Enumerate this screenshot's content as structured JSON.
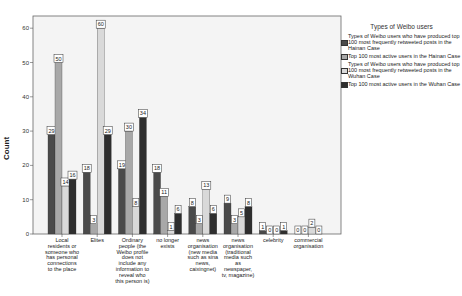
{
  "chart_data": {
    "type": "bar",
    "title": "",
    "xlabel": "",
    "ylabel": "Count",
    "ylim": [
      0,
      63
    ],
    "yticks": [
      0,
      10,
      20,
      30,
      40,
      50,
      60
    ],
    "grid": false,
    "legend_position": "right",
    "legend_title": "Types of Weibo users",
    "categories": [
      "Local residents or someone who has personal connections to the place",
      "Elites",
      "Ordinary people (the Weibo profile does not include any information to reveal who this person is)",
      "no longer exists",
      "news organisation (new media such as sina news, caixingnet)",
      "news organisation (traditional media such as newspaper, tv, magazine)",
      "celebrity",
      "commercial organisation"
    ],
    "series": [
      {
        "name": "Types of Weibo users who have produced top 100 most frequently retweeted posts in the Hainan Case",
        "color": "#4a4a4a",
        "values": [
          29,
          18,
          19,
          18,
          8,
          9,
          1,
          0
        ]
      },
      {
        "name": "Top 100 most active users in the Hainan Case",
        "color": "#a8a8a8",
        "values": [
          50,
          3,
          30,
          11,
          3,
          3,
          0,
          0
        ]
      },
      {
        "name": "Types of Weibo users who have produced top 100 most frequently retweeted posts in the Wuhan Case",
        "color": "#d9d9d9",
        "values": [
          14,
          60,
          8,
          1,
          13,
          5,
          0,
          2
        ]
      },
      {
        "name": "Top 100 most active users in the Wuhan Case",
        "color": "#2e2e2e",
        "values": [
          16,
          29,
          34,
          6,
          6,
          8,
          1,
          0
        ]
      }
    ]
  },
  "axis": {
    "ylabel": "Count",
    "ticks": [
      "0",
      "10",
      "20",
      "30",
      "40",
      "50",
      "60"
    ]
  },
  "xlabels": [
    [
      "Local",
      "residents or",
      "someone who",
      "has personal",
      "connections",
      "to the place"
    ],
    [
      "Elites"
    ],
    [
      "Ordinary",
      "people (the",
      "Weibo profile",
      "does not",
      "include any",
      "information to",
      "reveal who",
      "this person is)"
    ],
    [
      "no longer",
      "exists"
    ],
    [
      "news",
      "organisation",
      "(new media",
      "such as sina",
      "news,",
      "caixingnet)"
    ],
    [
      "news",
      "organisation",
      "(traditional",
      "media such",
      "as",
      "newspaper,",
      "tv, magazine)"
    ],
    [
      "celebrity"
    ],
    [
      "commercial",
      "organisation"
    ]
  ],
  "legend": {
    "title": "Types of Weibo users",
    "items": [
      {
        "label": "Types of Weibo users who have produced top 100 most frequently retweeted posts in the Hainan Case",
        "color": "#4a4a4a"
      },
      {
        "label": "Top 100 most active users in the Hainan Case",
        "color": "#a8a8a8"
      },
      {
        "label": "Types of Weibo users who have produced top 100 most frequently retweeted posts in the Wuhan Case",
        "color": "#d9d9d9"
      },
      {
        "label": "Top 100 most active users in the Wuhan Case",
        "color": "#2e2e2e"
      }
    ]
  }
}
